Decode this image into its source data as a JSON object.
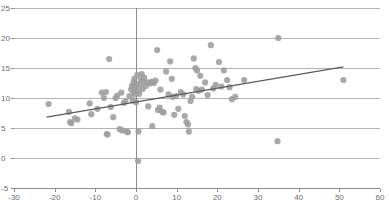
{
  "chart_data": {
    "type": "scatter",
    "title": "",
    "subtitle": "",
    "xlabel": "",
    "ylabel": "",
    "xlim": [
      -30,
      60
    ],
    "ylim": [
      -5,
      25
    ],
    "xticks": [
      -30,
      -20,
      -10,
      0,
      10,
      20,
      30,
      40,
      50,
      60
    ],
    "yticks": [
      -5,
      0,
      5,
      10,
      15,
      20,
      25
    ],
    "xtick_labels": [
      "-30",
      "-20",
      "-10",
      "0",
      "10",
      "20",
      "30",
      "40",
      "50",
      "60"
    ],
    "ytick_labels": [
      "-5",
      "0",
      "5",
      "10",
      "15",
      "20",
      "25"
    ],
    "grid": "horizontal",
    "legend": "none",
    "marker": {
      "shape": "circle",
      "color": "#9d9d9d",
      "radius_px": 3.1
    },
    "series": [
      {
        "name": "observations",
        "points": [
          [
            -21.5,
            9.0
          ],
          [
            -16.5,
            7.7
          ],
          [
            -16.2,
            6.0
          ],
          [
            -15.9,
            5.8
          ],
          [
            -15.0,
            6.6
          ],
          [
            -14.4,
            6.4
          ],
          [
            -11.4,
            9.1
          ],
          [
            -11.0,
            7.3
          ],
          [
            -9.5,
            8.2
          ],
          [
            -8.4,
            10.9
          ],
          [
            -7.9,
            10.0
          ],
          [
            -7.4,
            11.0
          ],
          [
            -7.2,
            4.0
          ],
          [
            -7.0,
            3.9
          ],
          [
            -6.6,
            16.5
          ],
          [
            -6.2,
            8.5
          ],
          [
            -5.6,
            6.8
          ],
          [
            -5.0,
            10.0
          ],
          [
            -4.6,
            10.4
          ],
          [
            -4.0,
            4.8
          ],
          [
            -3.6,
            10.9
          ],
          [
            -3.4,
            4.6
          ],
          [
            -3.0,
            9.2
          ],
          [
            -2.6,
            9.4
          ],
          [
            -2.3,
            4.4
          ],
          [
            -2.0,
            4.3
          ],
          [
            -1.6,
            10.3
          ],
          [
            -1.2,
            11.4
          ],
          [
            -1.0,
            12.0
          ],
          [
            -0.8,
            9.6
          ],
          [
            -0.6,
            12.6
          ],
          [
            -0.5,
            11.0
          ],
          [
            -0.4,
            13.2
          ],
          [
            -0.3,
            10.6
          ],
          [
            -0.2,
            11.8
          ],
          [
            0.0,
            9.3
          ],
          [
            0.2,
            12.3
          ],
          [
            0.3,
            13.8
          ],
          [
            0.4,
            11.2
          ],
          [
            0.5,
            -0.5
          ],
          [
            0.6,
            4.4
          ],
          [
            0.8,
            10.7
          ],
          [
            1.0,
            12.1
          ],
          [
            1.2,
            13.0
          ],
          [
            1.4,
            14.0
          ],
          [
            1.6,
            11.5
          ],
          [
            1.8,
            12.8
          ],
          [
            2.0,
            13.4
          ],
          [
            2.4,
            12.0
          ],
          [
            2.8,
            12.6
          ],
          [
            3.0,
            8.6
          ],
          [
            3.4,
            12.4
          ],
          [
            3.8,
            12.7
          ],
          [
            4.0,
            5.3
          ],
          [
            4.4,
            12.5
          ],
          [
            4.8,
            12.9
          ],
          [
            5.2,
            18.0
          ],
          [
            5.4,
            8.0
          ],
          [
            5.8,
            8.4
          ],
          [
            6.0,
            11.4
          ],
          [
            6.4,
            7.7
          ],
          [
            6.8,
            7.6
          ],
          [
            7.4,
            14.4
          ],
          [
            8.0,
            10.6
          ],
          [
            8.4,
            16.1
          ],
          [
            8.8,
            13.2
          ],
          [
            9.0,
            10.2
          ],
          [
            9.4,
            7.2
          ],
          [
            9.8,
            10.3
          ],
          [
            10.4,
            8.2
          ],
          [
            11.0,
            11.0
          ],
          [
            11.6,
            10.6
          ],
          [
            12.0,
            7.0
          ],
          [
            12.4,
            6.0
          ],
          [
            12.8,
            5.6
          ],
          [
            13.0,
            4.4
          ],
          [
            13.4,
            9.5
          ],
          [
            13.8,
            10.2
          ],
          [
            14.2,
            16.6
          ],
          [
            14.6,
            15.0
          ],
          [
            14.8,
            11.5
          ],
          [
            15.0,
            14.6
          ],
          [
            15.4,
            11.2
          ],
          [
            15.8,
            13.7
          ],
          [
            16.2,
            11.4
          ],
          [
            17.0,
            12.6
          ],
          [
            17.6,
            10.5
          ],
          [
            18.4,
            18.8
          ],
          [
            19.0,
            11.6
          ],
          [
            19.6,
            12.2
          ],
          [
            20.4,
            16.0
          ],
          [
            21.0,
            11.9
          ],
          [
            21.6,
            14.6
          ],
          [
            22.4,
            13.0
          ],
          [
            23.0,
            11.8
          ],
          [
            23.6,
            9.8
          ],
          [
            24.4,
            10.2
          ],
          [
            26.6,
            13.0
          ],
          [
            35.0,
            20.0
          ],
          [
            34.8,
            2.8
          ],
          [
            51.0,
            13.0
          ]
        ]
      }
    ],
    "trendline": {
      "name": "linear-fit",
      "color": "#5a5a5a",
      "x_start": -22.0,
      "y_start": 6.8,
      "x_end": 51.0,
      "y_end": 15.2
    }
  }
}
